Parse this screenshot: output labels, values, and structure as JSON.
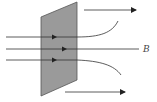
{
  "diagram": {
    "type": "magnetic-field-through-plate",
    "field_label": "B",
    "colors": {
      "plate_fill": "#9a9a9a",
      "plate_stroke": "#555555",
      "line": "#333333",
      "background": "#ffffff"
    },
    "plate": {
      "points": [
        [
          41,
          17
        ],
        [
          77,
          2
        ],
        [
          77,
          80
        ],
        [
          41,
          96
        ]
      ]
    },
    "field_lines": [
      {
        "name": "upper",
        "y": 37,
        "arrow_x": 55,
        "exit": "curves-up"
      },
      {
        "name": "middle",
        "y": 49,
        "arrow_x": 65,
        "exit": "straight"
      },
      {
        "name": "lower",
        "y": 60,
        "arrow_x": 55,
        "exit": "curves-down"
      }
    ],
    "force_arrows": [
      {
        "name": "top-arrow",
        "y": 10,
        "x1": 84,
        "x2": 136
      },
      {
        "name": "bottom-arrow",
        "y": 92,
        "x1": 65,
        "x2": 125
      }
    ]
  }
}
